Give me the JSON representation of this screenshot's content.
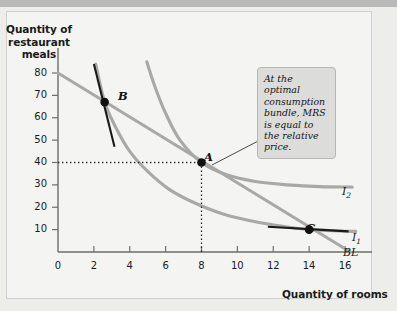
{
  "figure": {
    "background_color": "#ededea",
    "plot_background_color": "#f4f4f2",
    "topbar_color": "#b9b9b7",
    "curve_color": "#a8a8a6",
    "tangent_color": "#1a1a1a",
    "point_color": "#111111"
  },
  "annotation": {
    "text": "At the optimal consumption bundle, MRS is equal to the relative price."
  },
  "labels": {
    "point_a": "A",
    "point_b": "B",
    "point_c": "C",
    "curve_i2": "I",
    "curve_i2_sub": "2",
    "curve_i1": "I",
    "curve_i1_sub": "1",
    "budget_line": "BL"
  },
  "chart_data": {
    "type": "line",
    "title": "",
    "xlabel": "Quantity of rooms",
    "ylabel": "Quantity of restaurant meals",
    "xlim": [
      0,
      17.4
    ],
    "ylim": [
      0,
      88
    ],
    "xticks": [
      0,
      2,
      4,
      6,
      8,
      10,
      12,
      14,
      16
    ],
    "yticks": [
      10,
      20,
      30,
      40,
      50,
      60,
      70,
      80
    ],
    "grid": false,
    "legend_position": "inline-right",
    "series": [
      {
        "name": "BL",
        "label": "BL",
        "type": "line",
        "color": "#a8a8a6",
        "comment": "budget line, straight",
        "x": [
          0,
          16.3
        ],
        "y": [
          80,
          0
        ]
      },
      {
        "name": "I2",
        "label": "I2",
        "type": "curve",
        "color": "#a8a8a6",
        "comment": "higher indifference curve through A",
        "x": [
          4.95,
          5.4,
          6,
          6.8,
          8,
          9.4,
          11,
          12.8,
          14.6,
          16.4
        ],
        "y": [
          85,
          74,
          62,
          50,
          40,
          34.5,
          31.5,
          30,
          29.2,
          29
        ]
      },
      {
        "name": "I1",
        "label": "I1",
        "type": "curve",
        "comment": "lower indifference curve through B and C",
        "color": "#a8a8a6",
        "x": [
          2.1,
          2.6,
          3.2,
          4,
          5,
          6.2,
          7.6,
          9.2,
          11,
          12.8,
          14,
          15.6,
          16.6
        ],
        "y": [
          84,
          67,
          56,
          45,
          36,
          28,
          22,
          17,
          13.5,
          11.2,
          10,
          9.4,
          9.2
        ]
      }
    ],
    "points": [
      {
        "label": "A",
        "x": 8,
        "y": 40,
        "note": "optimal consumption bundle, tangency of BL and I2"
      },
      {
        "label": "B",
        "x": 2.6,
        "y": 67,
        "note": "on I1, MRS steeper than relative price"
      },
      {
        "label": "C",
        "x": 14,
        "y": 10,
        "note": "on I1, MRS flatter than relative price"
      }
    ],
    "tangents": [
      {
        "at_point": "B",
        "x": [
          2.0,
          3.15
        ],
        "y": [
          84,
          47
        ],
        "color": "#1a1a1a"
      },
      {
        "at_point": "C",
        "x": [
          11.7,
          16.2
        ],
        "y": [
          11.3,
          9.2
        ],
        "color": "#1a1a1a"
      }
    ],
    "dotted_guides": [
      {
        "from": [
          0,
          40
        ],
        "to": [
          8,
          40
        ]
      },
      {
        "from": [
          8,
          40
        ],
        "to": [
          8,
          0
        ]
      }
    ],
    "leader_lines": [
      {
        "from_point": "A",
        "to": "annotation-box"
      }
    ]
  }
}
